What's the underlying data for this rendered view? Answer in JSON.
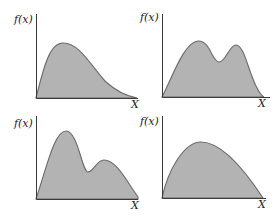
{
  "figure": {
    "colors": {
      "fill": "#b3b3b3",
      "stroke": "#6a6a6a",
      "axis": "#3a3a3a",
      "text": "#222222"
    },
    "panels": [
      {
        "id": "unimodal-right-skewed",
        "y_label": "f(x)",
        "x_label": "X",
        "origin": [
          36,
          98
        ],
        "y_top": 14,
        "x_end": 138,
        "y_label_pos": [
          14,
          23
        ],
        "x_label_pos": [
          131,
          108
        ],
        "curve": "M36,98 C42,75 48,44 62,43 C80,42 92,68 106,82 C116,91 126,96 137,98 Z"
      },
      {
        "id": "bimodal",
        "y_label": "f(x)",
        "x_label": "X",
        "origin": [
          162,
          97
        ],
        "y_top": 14,
        "x_end": 270,
        "y_label_pos": [
          140,
          21
        ],
        "x_label_pos": [
          258,
          107
        ],
        "curve": "M162,97 C172,78 184,42 198,41 C210,40 212,62 219,62 C226,62 229,45 236,45 C244,45 248,70 256,86 C259,92 261,96 264,97 Z"
      },
      {
        "id": "bimodal-tall-left",
        "y_label": "f(x)",
        "x_label": "X",
        "origin": [
          36,
          199
        ],
        "y_top": 116,
        "x_end": 138,
        "y_label_pos": [
          14,
          127
        ],
        "x_label_pos": [
          131,
          209
        ],
        "curve": "M36,199 C46,170 54,131 66,131 C78,131 82,172 88,172 C94,172 96,160 104,160 C116,160 126,180 138,197 L138,199 Z"
      },
      {
        "id": "unimodal-broad",
        "y_label": "f(x)",
        "x_label": "X",
        "origin": [
          162,
          198
        ],
        "y_top": 116,
        "x_end": 266,
        "y_label_pos": [
          140,
          125
        ],
        "x_label_pos": [
          258,
          208
        ],
        "curve": "M162,198 C168,170 184,142 201,142 C222,142 246,172 263,198 Z"
      }
    ]
  }
}
